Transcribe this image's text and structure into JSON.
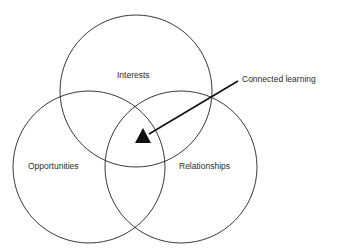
{
  "diagram": {
    "type": "venn",
    "circles": [
      {
        "id": "interests",
        "label": "Interests",
        "cx": 136,
        "cy": 91,
        "r": 76
      },
      {
        "id": "opportunities",
        "label": "Opportunities",
        "cx": 89,
        "cy": 167,
        "r": 76
      },
      {
        "id": "relationships",
        "label": "Relationships",
        "cx": 181,
        "cy": 167,
        "r": 76
      }
    ],
    "intersection_marker": {
      "shape": "triangle",
      "points": "143,128 135,143 151,143"
    },
    "callout": {
      "label": "Connected learning",
      "arrow": {
        "x1": 238,
        "y1": 81,
        "x2": 149,
        "y2": 134
      }
    },
    "colors": {
      "stroke": "#222222",
      "fill": "#111111",
      "background": "#ffffff"
    }
  }
}
